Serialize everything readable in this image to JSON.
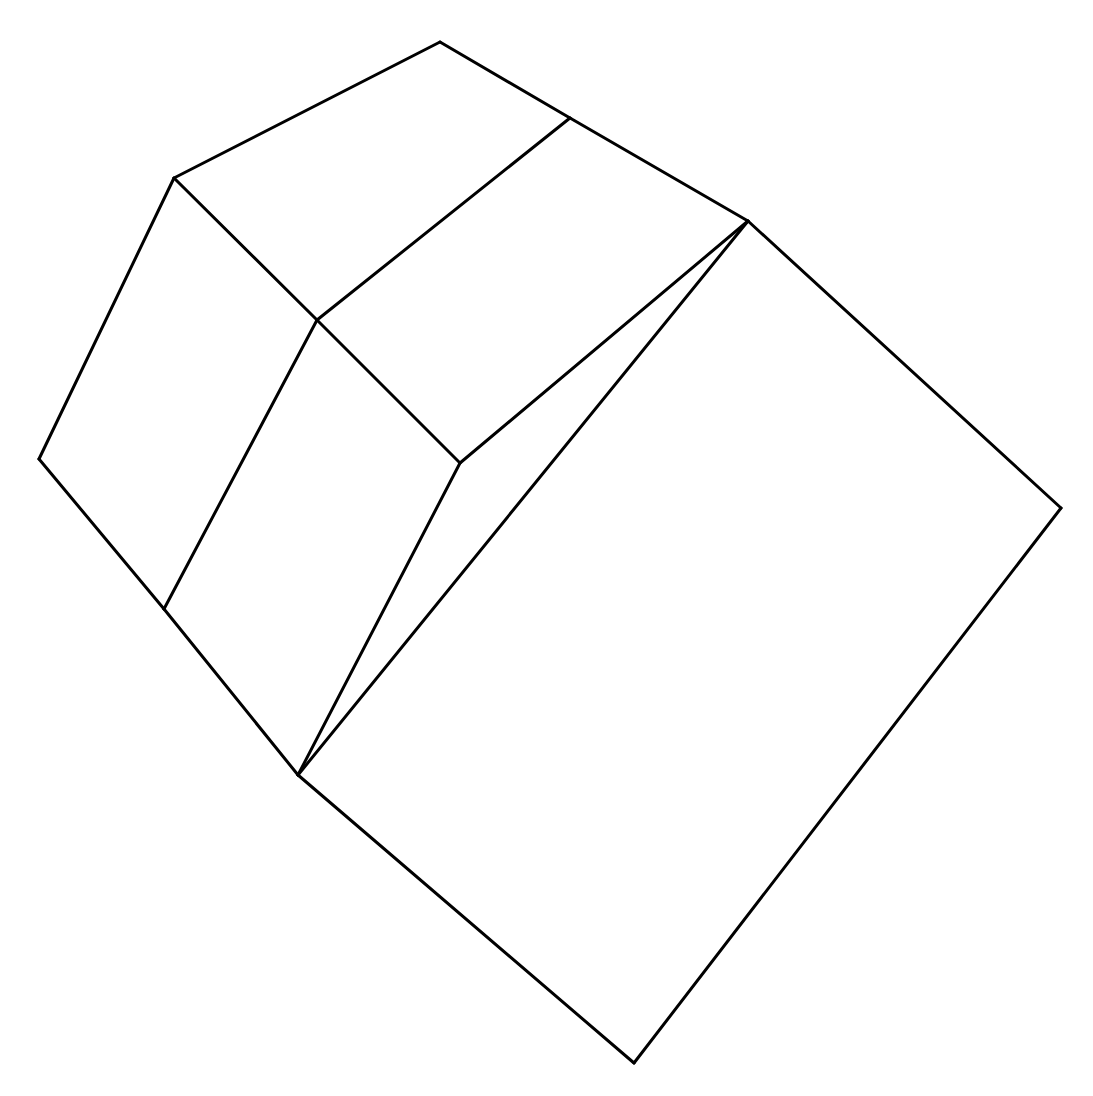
{
  "figure": {
    "stroke_color": "#000000",
    "background_color": "#ffffff",
    "vertices": {
      "A": [
        440,
        42
      ],
      "B": [
        174,
        178
      ],
      "C": [
        570,
        118
      ],
      "D": [
        748,
        221
      ],
      "E": [
        317,
        320
      ],
      "F": [
        460,
        463
      ],
      "G": [
        39,
        459
      ],
      "H": [
        164,
        609
      ],
      "I": [
        298,
        775
      ],
      "J": [
        1061,
        508
      ],
      "K": [
        634,
        1063
      ]
    },
    "edges": [
      [
        "A",
        "B"
      ],
      [
        "A",
        "C"
      ],
      [
        "C",
        "D"
      ],
      [
        "B",
        "G"
      ],
      [
        "B",
        "E"
      ],
      [
        "E",
        "C"
      ],
      [
        "E",
        "F"
      ],
      [
        "F",
        "D"
      ],
      [
        "E",
        "H"
      ],
      [
        "G",
        "H"
      ],
      [
        "H",
        "I"
      ],
      [
        "F",
        "I"
      ],
      [
        "D",
        "I"
      ],
      [
        "D",
        "J"
      ],
      [
        "J",
        "K"
      ],
      [
        "I",
        "K"
      ]
    ]
  },
  "caption": ""
}
